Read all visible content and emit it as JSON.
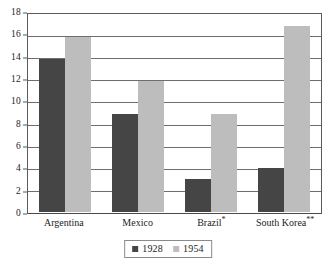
{
  "chart_data": {
    "type": "bar",
    "title": "",
    "subtitle": "",
    "xlabel": "",
    "ylabel": "",
    "categories": [
      "Argentina",
      "Mexico",
      "Brazil*",
      "South Korea**"
    ],
    "series": [
      {
        "name": "1928",
        "color": "#454545",
        "values": [
          14,
          9,
          3,
          4
        ]
      },
      {
        "name": "1954",
        "color": "#bdbdbd",
        "values": [
          16,
          12,
          9,
          17
        ]
      }
    ],
    "ylim": [
      0,
      18
    ],
    "ytick_step": 2,
    "yticks": [
      18,
      16,
      14,
      12,
      10,
      8,
      6,
      4,
      2,
      0
    ],
    "ytick_labels": [
      "18",
      "16",
      "14",
      "12",
      "10",
      "8",
      "6",
      "4",
      "2",
      "0"
    ],
    "grid": true,
    "grid_axis": "y",
    "legend_position": "bottom-center",
    "legend_boxed": true,
    "annotations": [],
    "category_footnotes": {
      "Brazil*": "*",
      "South Korea**": "**"
    }
  },
  "figure": {
    "background_color": "#ffffff",
    "axis_color": "#5b5b5b",
    "grid_color": "#6e6e6e",
    "text_color": "#232323"
  }
}
